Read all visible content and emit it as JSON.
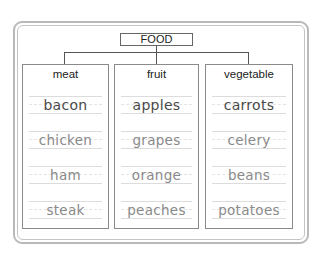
{
  "diagram": {
    "root": "FOOD",
    "columns": [
      {
        "heading": "meat",
        "items": [
          "bacon",
          "chicken",
          "ham",
          "steak"
        ]
      },
      {
        "heading": "fruit",
        "items": [
          "apples",
          "grapes",
          "orange",
          "peaches"
        ]
      },
      {
        "heading": "vegetable",
        "items": [
          "carrots",
          "celery",
          "beans",
          "potatoes"
        ]
      }
    ]
  },
  "colors": {
    "frame": "#b9b9b9",
    "connector": "#555555",
    "first_item_text": "#4a4a4a",
    "item_text": "#8a8a8a",
    "rule_lines": "#dcdcdc"
  }
}
